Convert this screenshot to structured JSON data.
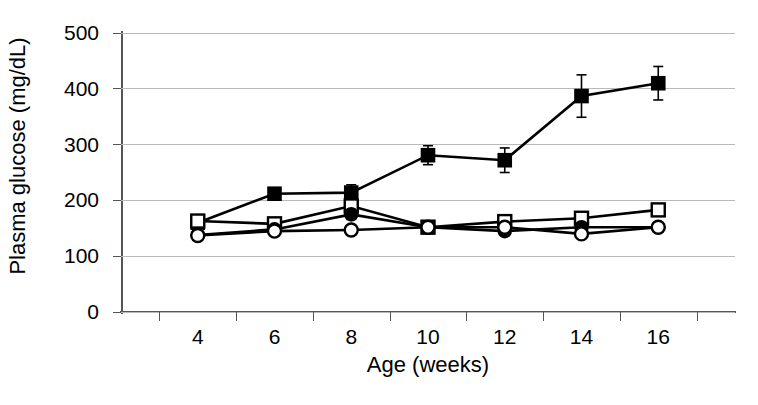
{
  "chart_data": {
    "type": "line",
    "title": "",
    "xlabel": "Age (weeks)",
    "ylabel": "Plasma glucose (mg/dL)",
    "x": [
      4,
      6,
      8,
      10,
      12,
      14,
      16
    ],
    "xtick_labels": [
      "4",
      "6",
      "8",
      "10",
      "12",
      "14",
      "16"
    ],
    "ytick_labels": [
      "0",
      "100",
      "200",
      "300",
      "400",
      "500"
    ],
    "ytick_values": [
      0,
      100,
      200,
      300,
      400,
      500
    ],
    "ylim": [
      0,
      500
    ],
    "grid": "horizontal",
    "legend": "none",
    "series": [
      {
        "name": "filled-square",
        "marker": "filled-square",
        "values": [
          160,
          212,
          214,
          281,
          272,
          387,
          410
        ],
        "errors": [
          8,
          8,
          14,
          17,
          22,
          38,
          30
        ]
      },
      {
        "name": "open-square",
        "marker": "open-square",
        "values": [
          163,
          158,
          190,
          152,
          162,
          168,
          183
        ],
        "errors": [
          11,
          6,
          10,
          6,
          8,
          10,
          7
        ]
      },
      {
        "name": "filled-circle",
        "marker": "filled-circle",
        "values": [
          138,
          148,
          175,
          152,
          145,
          152,
          152
        ],
        "errors": [
          5,
          5,
          9,
          5,
          5,
          5,
          7
        ]
      },
      {
        "name": "open-circle",
        "marker": "open-circle",
        "values": [
          137,
          145,
          147,
          152,
          152,
          140,
          152
        ],
        "errors": [
          5,
          5,
          5,
          5,
          6,
          7,
          7
        ]
      }
    ]
  },
  "colors": {
    "marker": "#000000",
    "line": "#000000",
    "grid": "#b9b9b9",
    "axis": "#555555",
    "background": "#ffffff"
  }
}
